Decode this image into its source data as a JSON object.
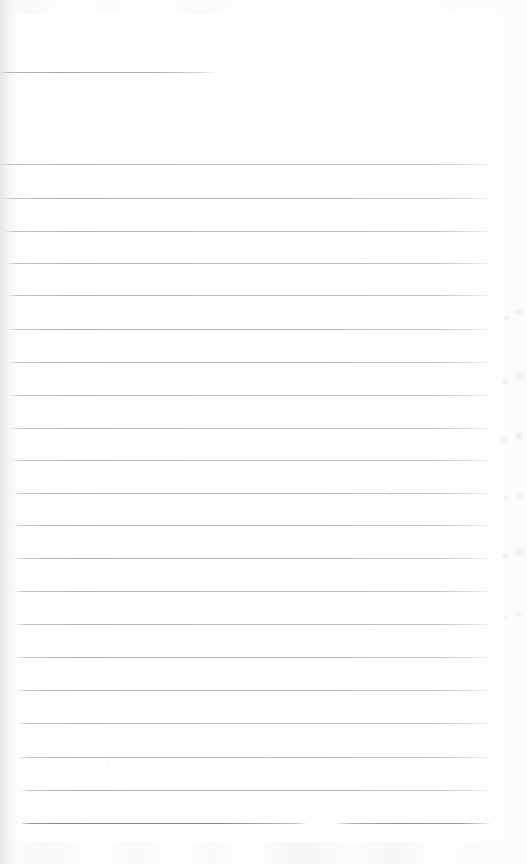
{
  "document": {
    "kind": "scanned-lined-paper",
    "title": "Blank ruled notebook page",
    "page_width": 527,
    "page_height": 864,
    "orientation": "portrait",
    "content_text": "",
    "handwriting_present": "no",
    "printed_text_present": "no"
  },
  "colors": {
    "background": "#fefefe",
    "paper_tint": "#fbfbfc",
    "rule_line": "#b2b6bb",
    "rule_line_heavy": "#868b92",
    "left_edge_shadow": "#d6d8db",
    "margin_smudge": "#eaecee"
  },
  "layout": {
    "rule_left_x": 14,
    "rule_right_x": 492,
    "rule_spacing": 32.8,
    "first_full_rule_y": 164,
    "last_rule_y": 823,
    "total_rules": 22
  },
  "rules": [
    {
      "id": "rule-heading",
      "y": 72,
      "x": 0,
      "width": 216,
      "weight": "short"
    },
    {
      "id": "rule-01",
      "y": 164,
      "x": 0,
      "width": 492,
      "weight": "normal"
    },
    {
      "id": "rule-02",
      "y": 198,
      "x": 2,
      "width": 490,
      "weight": "normal"
    },
    {
      "id": "rule-03",
      "y": 231,
      "x": 4,
      "width": 488,
      "weight": "normal"
    },
    {
      "id": "rule-04",
      "y": 263,
      "x": 6,
      "width": 486,
      "weight": "normal"
    },
    {
      "id": "rule-05",
      "y": 295,
      "x": 7,
      "width": 485,
      "weight": "normal"
    },
    {
      "id": "rule-06",
      "y": 329,
      "x": 8,
      "width": 484,
      "weight": "normal"
    },
    {
      "id": "rule-07",
      "y": 362,
      "x": 9,
      "width": 483,
      "weight": "normal"
    },
    {
      "id": "rule-08",
      "y": 395,
      "x": 10,
      "width": 482,
      "weight": "normal"
    },
    {
      "id": "rule-09",
      "y": 428,
      "x": 11,
      "width": 481,
      "weight": "normal"
    },
    {
      "id": "rule-10",
      "y": 460,
      "x": 12,
      "width": 480,
      "weight": "normal"
    },
    {
      "id": "rule-11",
      "y": 493,
      "x": 13,
      "width": 479,
      "weight": "normal"
    },
    {
      "id": "rule-12",
      "y": 525,
      "x": 13,
      "width": 479,
      "weight": "normal"
    },
    {
      "id": "rule-13",
      "y": 558,
      "x": 14,
      "width": 478,
      "weight": "normal"
    },
    {
      "id": "rule-14",
      "y": 591,
      "x": 14,
      "width": 478,
      "weight": "normal"
    },
    {
      "id": "rule-15",
      "y": 624,
      "x": 15,
      "width": 477,
      "weight": "normal"
    },
    {
      "id": "rule-16",
      "y": 657,
      "x": 16,
      "width": 476,
      "weight": "normal"
    },
    {
      "id": "rule-17",
      "y": 690,
      "x": 17,
      "width": 475,
      "weight": "normal"
    },
    {
      "id": "rule-18",
      "y": 723,
      "x": 18,
      "width": 474,
      "weight": "normal"
    },
    {
      "id": "rule-19",
      "y": 757,
      "x": 19,
      "width": 473,
      "weight": "normal"
    },
    {
      "id": "rule-20",
      "y": 790,
      "x": 20,
      "width": 472,
      "weight": "normal"
    },
    {
      "id": "rule-21",
      "y": 823,
      "x": 22,
      "width": 286,
      "weight": "heavy"
    },
    {
      "id": "rule-21b",
      "y": 823,
      "x": 333,
      "width": 159,
      "weight": "heavy-tail"
    }
  ],
  "marks": [
    {
      "id": "pen-tick-1",
      "x": 390,
      "y": 493,
      "description": "faint vertical pen tick below rule-11"
    },
    {
      "id": "speck-1",
      "x": 107,
      "y": 763,
      "size": 2
    },
    {
      "id": "speck-2",
      "x": 268,
      "y": 757,
      "size": 2
    },
    {
      "id": "speck-3",
      "x": 215,
      "y": 626,
      "size": 2
    }
  ]
}
